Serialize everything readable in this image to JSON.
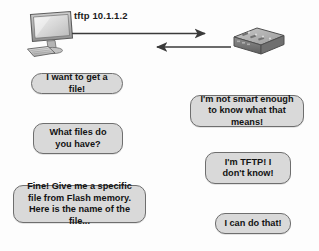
{
  "diagram": {
    "command_label": "tftp 10.1.1.2",
    "devices": [
      {
        "name": "pc",
        "icon": "desktop-computer-icon",
        "label": ""
      },
      {
        "name": "switch",
        "icon": "network-switch-icon",
        "label": ""
      }
    ],
    "arrows": [
      {
        "name": "request-arrow",
        "direction": "right"
      },
      {
        "name": "response-arrow",
        "direction": "left"
      }
    ],
    "bubbles": {
      "request_1": "I want to get a file!",
      "response_1": "I'm not smart enough to know what that means!",
      "request_2": "What files do you have?",
      "response_2": "I'm TFTP! I don't know!",
      "request_3": "Fine! Give me a specific file from Flash memory. Here is the name of the file...",
      "response_3": "I can do that!"
    }
  },
  "colors": {
    "bubble_fill": "#d9d9d9",
    "bubble_border": "#6e6e6e",
    "text": "#131313",
    "arrow": "#3a3a3a",
    "background": "#fdfdfd"
  }
}
